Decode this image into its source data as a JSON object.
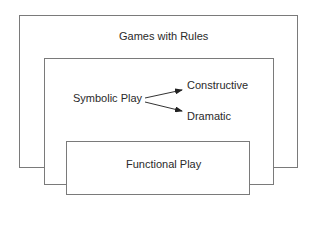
{
  "diagram": {
    "outer_box": {
      "label": "Games with Rules"
    },
    "middle_box": {
      "label": "Symbolic Play",
      "branches": [
        "Constructive",
        "Dramatic"
      ]
    },
    "inner_box": {
      "label": "Functional Play"
    },
    "colors": {
      "border": "#7a7a7a",
      "text": "#2a2a2a",
      "arrow": "#222222"
    }
  }
}
